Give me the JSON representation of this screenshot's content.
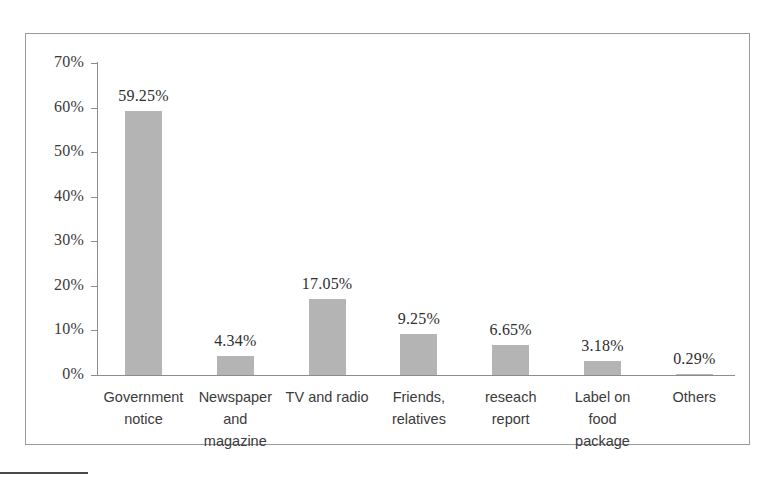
{
  "chart_data": {
    "type": "bar",
    "title": "",
    "subtitle": "",
    "xlabel": "",
    "ylabel": "",
    "ylim": [
      0,
      70
    ],
    "ytick_step": 10,
    "ytick_labels": [
      "0%",
      "10%",
      "20%",
      "30%",
      "40%",
      "50%",
      "60%",
      "70%"
    ],
    "ytick_values": [
      0,
      10,
      20,
      30,
      40,
      50,
      60,
      70
    ],
    "grid": false,
    "legend": "none",
    "value_label_suffix": "%",
    "bar_color": "#b4b4b4",
    "axis_color": "#8d8d8d",
    "categories": [
      "Government notice",
      "Newspaper and magazine",
      "TV and radio",
      "Friends, relatives",
      "reseach report",
      "Label on food package",
      "Others"
    ],
    "category_lines": [
      [
        "Government",
        "notice"
      ],
      [
        "Newspaper",
        "and",
        "magazine"
      ],
      [
        "TV and radio"
      ],
      [
        "Friends,",
        "relatives"
      ],
      [
        "reseach",
        "report"
      ],
      [
        "Label on",
        "food",
        "package"
      ],
      [
        "Others"
      ]
    ],
    "values": [
      59.25,
      4.34,
      17.05,
      9.25,
      6.65,
      3.18,
      0.29
    ],
    "value_labels": [
      "59.25%",
      "4.34%",
      "17.05%",
      "9.25%",
      "6.65%",
      "3.18%",
      "0.29%"
    ]
  }
}
